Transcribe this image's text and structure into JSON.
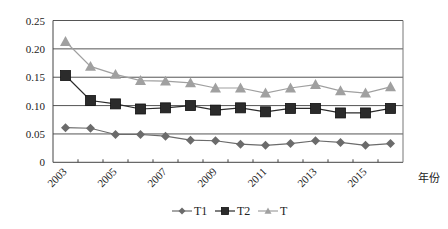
{
  "chart_data": {
    "type": "line",
    "title": "",
    "xlabel": "年份",
    "ylabel": "",
    "ylim": [
      0,
      0.25
    ],
    "yticks": [
      "0",
      "0.05",
      "0.10",
      "0.15",
      "0.20",
      "0.25"
    ],
    "x": [
      "2003",
      "2004",
      "2005",
      "2006",
      "2007",
      "2008",
      "2009",
      "2010",
      "2011",
      "2012",
      "2013",
      "2014",
      "2015",
      "2016"
    ],
    "xtick_labels": [
      "2003",
      "2005",
      "2007",
      "2009",
      "2011",
      "2013",
      "2015"
    ],
    "grid": "horizontal",
    "legend_position": "bottom",
    "series": [
      {
        "name": "T1",
        "marker": "diamond",
        "color": "#6b6b6b",
        "values": [
          0.061,
          0.06,
          0.049,
          0.049,
          0.046,
          0.039,
          0.038,
          0.032,
          0.03,
          0.033,
          0.038,
          0.035,
          0.03,
          0.033
        ]
      },
      {
        "name": "T2",
        "marker": "square",
        "color": "#2b2b2b",
        "values": [
          0.153,
          0.109,
          0.103,
          0.094,
          0.096,
          0.1,
          0.092,
          0.096,
          0.089,
          0.095,
          0.095,
          0.087,
          0.087,
          0.095
        ]
      },
      {
        "name": "T",
        "marker": "triangle",
        "color": "#a0a0a0",
        "values": [
          0.213,
          0.169,
          0.155,
          0.144,
          0.143,
          0.14,
          0.131,
          0.131,
          0.122,
          0.131,
          0.137,
          0.126,
          0.122,
          0.133
        ]
      }
    ]
  },
  "legend": {
    "items": [
      {
        "label": "T1"
      },
      {
        "label": "T2"
      },
      {
        "label": "T"
      }
    ]
  }
}
